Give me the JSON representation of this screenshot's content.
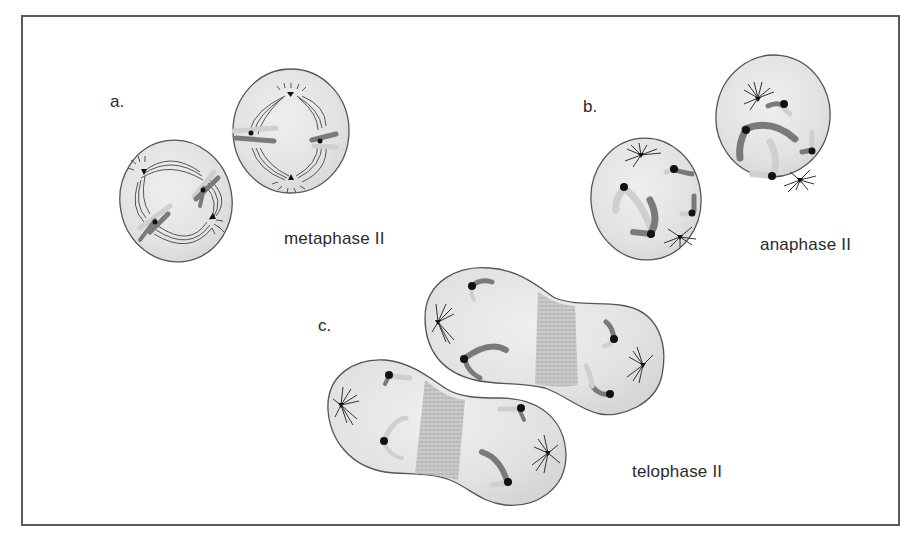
{
  "figure": {
    "panels": [
      {
        "letter": "a.",
        "label": "metaphase II"
      },
      {
        "letter": "b.",
        "label": "anaphase II"
      },
      {
        "letter": "c.",
        "label": "telophase II"
      }
    ]
  },
  "colors": {
    "frame": "#5a5a5a",
    "cell_fill": "#e4e4e4",
    "cell_outline": "#555555",
    "chromatid_dark": "#7a7a7a",
    "chromatid_light": "#cfcfcf",
    "centromere": "#111111",
    "spindle": "#444444",
    "text": "#2a2a2a"
  }
}
